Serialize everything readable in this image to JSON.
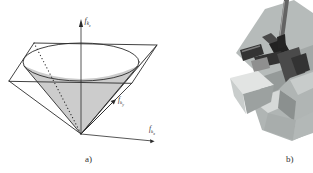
{
  "figure": {
    "panel_a": {
      "caption": "a)",
      "axis_labels": {
        "z": {
          "base": "f",
          "sub": "k",
          "subsub": "z"
        },
        "y": {
          "base": "f",
          "sub": "k",
          "subsub": "y"
        },
        "x": {
          "base": "f",
          "sub": "k",
          "subsub": "x"
        }
      },
      "colors": {
        "line": "#2b2b2b",
        "cone_shade": "#cccccc",
        "text": "#2f2f2f"
      }
    },
    "panel_b": {
      "caption": "b)",
      "palette": {
        "slab": "#b6bbba",
        "slab_shadow": "#a3a8a7",
        "workpiece": "#959a99",
        "wedge_top": "#e2e4e3",
        "wedge_left": "#c9cdcc",
        "wedge_right": "#9ca1a0",
        "block_base": "#b0b5b4",
        "block_top": "#d6d9d8",
        "block_top2": "#c8cccb",
        "block_dark": "#8b908f",
        "block_front": "#a8adac",
        "block_front2": "#b3b8b7",
        "gripper_dark": "#333333",
        "gripper_darker": "#222222",
        "gripper_mid": "#4a4a4a",
        "gripper_light": "#8f8f8f",
        "rod": "#636363",
        "rod_tip": "#242424"
      },
      "caption_color": "#2f2f2f"
    }
  }
}
